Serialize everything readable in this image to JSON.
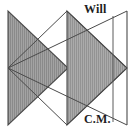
{
  "figure": {
    "background_color": "#ffffff",
    "line_color": "#3a3a3a",
    "fill_color": "#9b9b9b",
    "hatch_color": "#6e6e6e",
    "hatch_style": "vertical-lines",
    "width": 134,
    "height": 135,
    "labels": {
      "top_right": "Will",
      "bottom_right": "C.M."
    },
    "shapes": [
      {
        "name": "left-pointing-shaded-triangle",
        "type": "triangle",
        "filled": true,
        "points": "8,11 8,125 68,68"
      },
      {
        "name": "right-pointing-shaded-triangle",
        "type": "triangle",
        "filled": true,
        "points": "67,11 67,125 127,68"
      },
      {
        "name": "upper-outline-triangle",
        "type": "open-line",
        "filled": false,
        "points": "8,68 127,11 127,125"
      }
    ],
    "guides": [
      {
        "name": "inner-vertical-guide",
        "x1": 113,
        "y1": 16,
        "x2": 113,
        "y2": 122
      },
      {
        "name": "outer-vertical-axis",
        "x1": 127,
        "y1": 11,
        "x2": 127,
        "y2": 125
      },
      {
        "name": "upper-diagonal-will",
        "x1": 8,
        "y1": 68,
        "x2": 127,
        "y2": 11
      },
      {
        "name": "lower-diagonal-cm",
        "x1": 8,
        "y1": 68,
        "x2": 127,
        "y2": 125
      }
    ]
  }
}
